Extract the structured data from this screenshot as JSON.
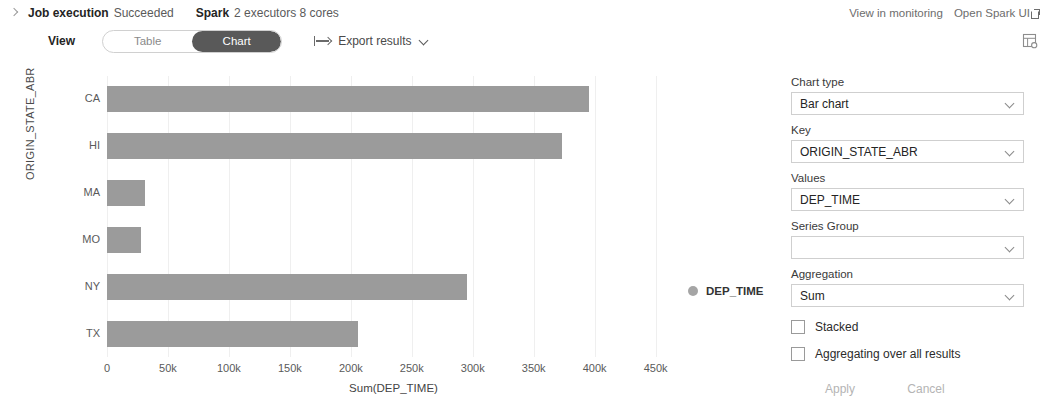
{
  "header": {
    "expand_icon": "chevron-right-icon",
    "job_label": "Job execution",
    "job_status": "Succeeded",
    "engine_label": "Spark",
    "engine_detail": "2 executors 8 cores",
    "view_in_monitoring": "View in monitoring",
    "open_spark_ui": "Open Spark UI",
    "external_link_icon": "external-link-icon"
  },
  "toolbar": {
    "view_label": "View",
    "toggle_options": [
      "Table",
      "Chart"
    ],
    "selected_toggle": "Chart",
    "export_icon": "export-arrow-icon",
    "export_label": "Export results",
    "export_chevron_icon": "chevron-down-icon",
    "settings_icon": "table-settings-icon"
  },
  "chart_data": {
    "type": "bar",
    "orientation": "horizontal",
    "title": "",
    "categories": [
      "CA",
      "HI",
      "MA",
      "MO",
      "NY",
      "TX"
    ],
    "values": [
      395000,
      373000,
      31000,
      28000,
      295000,
      206000
    ],
    "series": [
      {
        "name": "DEP_TIME",
        "values": [
          395000,
          373000,
          31000,
          28000,
          295000,
          206000
        ]
      }
    ],
    "xlabel": "Sum(DEP_TIME)",
    "ylabel": "ORIGIN_STATE_ABR",
    "xlim": [
      0,
      470000
    ],
    "xticks": [
      0,
      50000,
      100000,
      150000,
      200000,
      250000,
      300000,
      350000,
      400000,
      450000
    ],
    "xtick_labels": [
      "0",
      "50k",
      "100k",
      "150k",
      "200k",
      "250k",
      "300k",
      "350k",
      "400k",
      "450k"
    ],
    "grid": true,
    "legend": [
      "DEP_TIME"
    ],
    "legend_position": "right",
    "bar_color": "#9b9b9b"
  },
  "panel": {
    "chart_type_label": "Chart type",
    "chart_type_value": "Bar chart",
    "key_label": "Key",
    "key_value": "ORIGIN_STATE_ABR",
    "values_label": "Values",
    "values_value": "DEP_TIME",
    "series_group_label": "Series Group",
    "series_group_value": "",
    "aggregation_label": "Aggregation",
    "aggregation_value": "Sum",
    "stacked_label": "Stacked",
    "stacked_checked": false,
    "aggregating_all_label": "Aggregating over all results",
    "aggregating_all_checked": false,
    "apply_label": "Apply",
    "cancel_label": "Cancel"
  }
}
